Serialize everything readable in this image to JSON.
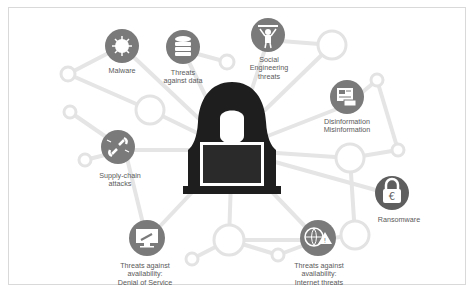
{
  "diagram": {
    "center": {
      "label": "hacker-with-laptop",
      "color": "#1e1e1e"
    },
    "node_color": "#7a7a7a",
    "accent_node_color": "#5e5e5e",
    "line_color": "#e3e3e3",
    "nodes": [
      {
        "id": "malware",
        "label": "Malware",
        "icon": "virus-icon"
      },
      {
        "id": "data",
        "label": "Threats\nagainst data",
        "icon": "database-icon"
      },
      {
        "id": "social",
        "label": "Social\nEngineering\nthreats",
        "icon": "puppet-person-icon"
      },
      {
        "id": "disinfo",
        "label": "Disinformation\nMisinformation",
        "icon": "fake-news-icon"
      },
      {
        "id": "supply",
        "label": "Supply-chain\nattacks",
        "icon": "broken-chain-icon"
      },
      {
        "id": "ransomware",
        "label": "Ransomware",
        "icon": "padlock-euro-icon"
      },
      {
        "id": "dos",
        "label": "Threats against\navailability:\nDenial of Service",
        "icon": "monitor-hammer-icon"
      },
      {
        "id": "internet",
        "label": "Threats against\navailability:\nInternet threats",
        "icon": "globe-warning-icon"
      }
    ]
  }
}
